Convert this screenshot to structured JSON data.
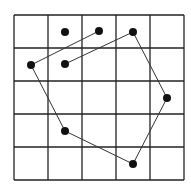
{
  "diagram": {
    "grid": {
      "x_lines": [
        14,
        48,
        82,
        116,
        150,
        184
      ],
      "y_lines": [
        15,
        48,
        81,
        114,
        147,
        180
      ],
      "stroke": "#222222",
      "stroke_width": 1.3
    },
    "points": [
      {
        "id": "p1",
        "x": 65,
        "y": 32
      },
      {
        "id": "p2",
        "x": 99,
        "y": 31
      },
      {
        "id": "p3",
        "x": 133,
        "y": 32
      },
      {
        "id": "p4",
        "x": 31,
        "y": 65
      },
      {
        "id": "p5",
        "x": 65,
        "y": 64
      },
      {
        "id": "p6",
        "x": 167,
        "y": 98
      },
      {
        "id": "p7",
        "x": 65,
        "y": 131
      },
      {
        "id": "p8",
        "x": 133,
        "y": 164
      }
    ],
    "path": [
      "p2",
      "p4",
      "p7",
      "p8",
      "p6",
      "p3",
      "p5"
    ],
    "point_radius": 4,
    "point_color": "#111111",
    "line_color": "#333333",
    "line_width": 1
  }
}
